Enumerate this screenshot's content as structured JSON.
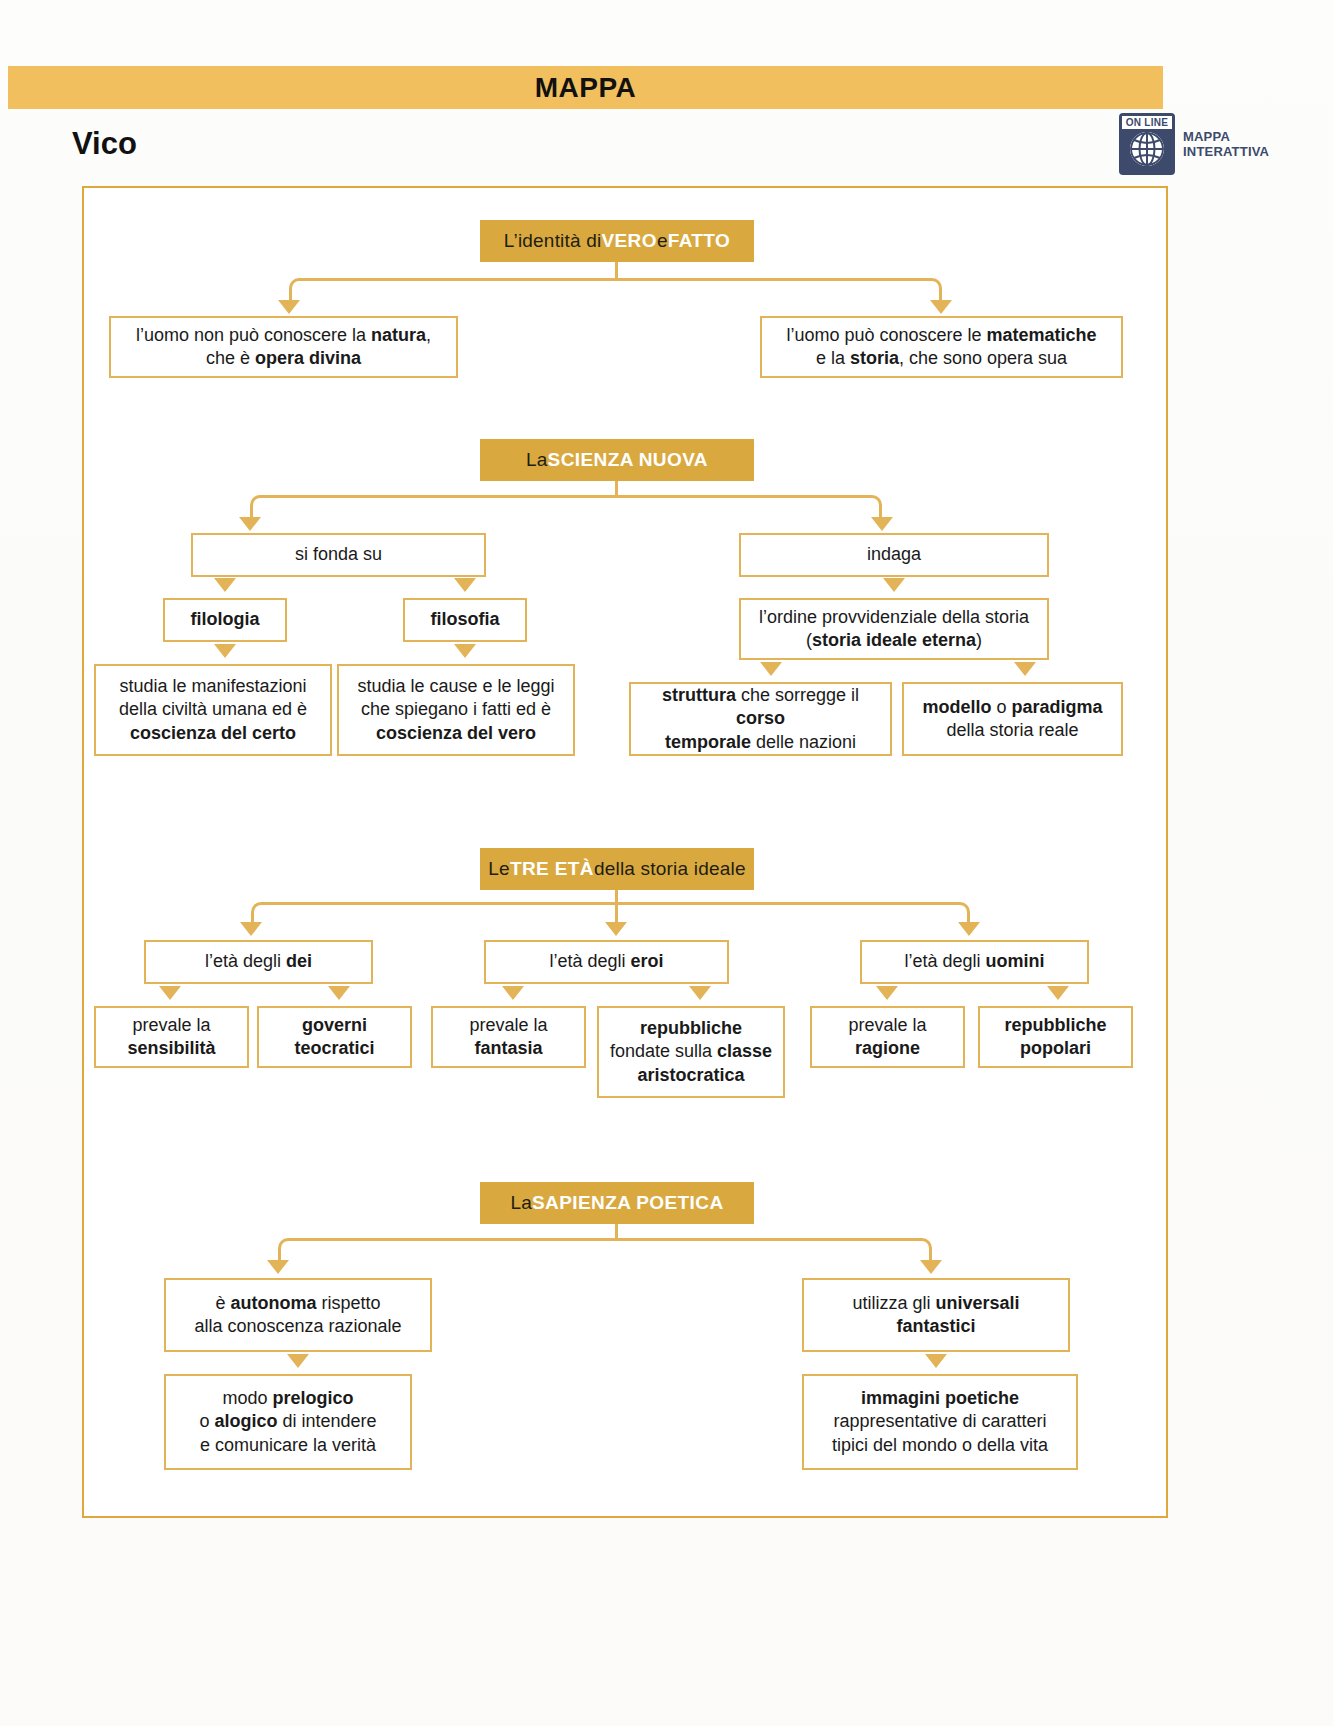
{
  "header": {
    "mappa_label": "MAPPA",
    "title": "Vico",
    "badge": {
      "online": "ON LINE",
      "line1": "MAPPA",
      "line2": "INTERATTIVA",
      "icon": "globe-icon",
      "color": "#3d4a6b"
    },
    "bar_color": "#f2bf5e"
  },
  "colors": {
    "banner_bg": "#d9a93f",
    "border": "#e3b358",
    "frame": "#e0a83c",
    "text": "#1a1a1a"
  },
  "diagram": {
    "type": "concept-map",
    "sections": [
      {
        "id": "vero-fatto",
        "banner": {
          "pre": "L’identità di ",
          "hl1": "VERO",
          "mid": " e ",
          "hl2": "FATTO"
        },
        "children": [
          {
            "id": "natura",
            "text": "l’uomo non può conoscere la <b>natura</b>,<br>che è <b>opera divina</b>"
          },
          {
            "id": "matematiche",
            "text": "l’uomo può conoscere le <b>matematiche</b><br>e la <b>storia</b>, che sono opera sua"
          }
        ]
      },
      {
        "id": "scienza-nuova",
        "banner": {
          "pre": "La ",
          "hl1": "SCIENZA NUOVA",
          "mid": "",
          "hl2": ""
        },
        "children": [
          {
            "id": "si-fonda-su",
            "text": "si fonda su"
          },
          {
            "id": "indaga",
            "text": "indaga"
          },
          {
            "id": "filologia",
            "text": "<b>filologia</b>"
          },
          {
            "id": "filosofia",
            "text": "<b>filosofia</b>"
          },
          {
            "id": "ordine-provvidenziale",
            "text": "l’ordine provvidenziale della storia<br>(<b>storia ideale eterna</b>)"
          },
          {
            "id": "coscienza-certo",
            "text": "studia le manifestazioni<br>della civiltà umana ed è<br><b>coscienza del certo</b>"
          },
          {
            "id": "coscienza-vero",
            "text": "studia le cause e le leggi<br>che spiegano i fatti ed è<br><b>coscienza del vero</b>"
          },
          {
            "id": "struttura",
            "text": "<b>struttura</b> che sorregge il <b>corso</b><br><b>temporale</b> delle nazioni"
          },
          {
            "id": "modello",
            "text": "<b>modello</b> o <b>paradigma</b><br>della storia reale"
          }
        ]
      },
      {
        "id": "tre-eta",
        "banner": {
          "pre": "Le ",
          "hl1": "TRE ETÀ",
          "mid": " della storia ideale",
          "hl2": ""
        },
        "children": [
          {
            "id": "eta-dei",
            "text": "l’età degli <b>dei</b>"
          },
          {
            "id": "eta-eroi",
            "text": "l’età degli <b>eroi</b>"
          },
          {
            "id": "eta-uomini",
            "text": "l’età degli <b>uomini</b>"
          },
          {
            "id": "sensibilita",
            "text": "prevale la<br><b>sensibilità</b>"
          },
          {
            "id": "governi-teocratici",
            "text": "<b>governi</b><br><b>teocratici</b>"
          },
          {
            "id": "fantasia",
            "text": "prevale la<br><b>fantasia</b>"
          },
          {
            "id": "repubbliche-aristocratiche",
            "text": "<b>repubbliche</b><br>fondate sulla <b>classe</b><br><b>aristocratica</b>"
          },
          {
            "id": "ragione",
            "text": "prevale la<br><b>ragione</b>"
          },
          {
            "id": "repubbliche-popolari",
            "text": "<b>repubbliche</b><br><b>popolari</b>"
          }
        ]
      },
      {
        "id": "sapienza-poetica",
        "banner": {
          "pre": "La ",
          "hl1": "SAPIENZA POETICA",
          "mid": "",
          "hl2": ""
        },
        "children": [
          {
            "id": "autonoma",
            "text": "è <b>autonoma</b> rispetto<br>alla conoscenza razionale"
          },
          {
            "id": "universali-fantastici",
            "text": "utilizza gli <b>universali</b><br><b>fantastici</b>"
          },
          {
            "id": "prelogico",
            "text": "modo <b>prelogico</b><br>o <b>alogico</b> di intendere<br>e comunicare la verità"
          },
          {
            "id": "immagini-poetiche",
            "text": "<b>immagini poetiche</b><br>rappresentative di caratteri<br>tipici del mondo o della vita"
          }
        ]
      }
    ]
  }
}
